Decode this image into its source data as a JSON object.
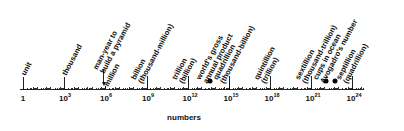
{
  "chart_data": {
    "type": "scatter",
    "title": "",
    "xlabel": "numbers",
    "ylabel": "",
    "xscale": "log10",
    "xlim_exponent": [
      0,
      25
    ],
    "grid": false,
    "legend": null,
    "ticks": [
      {
        "exponent": 0,
        "label": "1"
      },
      {
        "exponent": 3,
        "label": "10",
        "sup": "3"
      },
      {
        "exponent": 6,
        "label": "10",
        "sup": "6"
      },
      {
        "exponent": 9,
        "label": "10",
        "sup": "9"
      },
      {
        "exponent": 12,
        "label": "10",
        "sup": "12"
      },
      {
        "exponent": 15,
        "label": "10",
        "sup": "15"
      },
      {
        "exponent": 18,
        "label": "10",
        "sup": "18"
      },
      {
        "exponent": 21,
        "label": "10",
        "sup": "21"
      },
      {
        "exponent": 24,
        "label": "10",
        "sup": "24"
      }
    ],
    "named_numbers": [
      {
        "exponent": 0,
        "lines": [
          "unit"
        ],
        "marker": "line"
      },
      {
        "exponent": 3,
        "lines": [
          "thousand"
        ],
        "marker": "line"
      },
      {
        "exponent": 6,
        "lines": [
          "million"
        ],
        "marker": "arrow"
      },
      {
        "exponent": 9,
        "lines": [
          "billion",
          "(thousand-million)"
        ],
        "marker": "line"
      },
      {
        "exponent": 12,
        "lines": [
          "trillion",
          "(billion)"
        ],
        "marker": "line"
      },
      {
        "exponent": 15,
        "lines": [
          "quadrillion",
          "(thousand-billion)"
        ],
        "marker": "line"
      },
      {
        "exponent": 18,
        "lines": [
          "quintillion",
          "(trillion)"
        ],
        "marker": "line"
      },
      {
        "exponent": 21,
        "lines": [
          "sextillion",
          "(thousand-trillion)"
        ],
        "marker": "line"
      },
      {
        "exponent": 24,
        "lines": [
          "septillion",
          "(quadrillion)"
        ],
        "marker": "line"
      }
    ],
    "annotations": [
      {
        "exponent": 6,
        "lines": [
          "man-year to",
          "build a pyramid"
        ],
        "marker": "arrow"
      },
      {
        "exponent": 13.5,
        "lines": [
          "world's gross",
          "annual product"
        ],
        "marker": "dot"
      },
      {
        "exponent": 22.2,
        "lines": [
          "cups in ocean"
        ],
        "marker": "dot"
      },
      {
        "exponent": 23.8,
        "lines": [
          "Avogadro's number"
        ],
        "marker": "dot"
      }
    ]
  },
  "labels": {
    "xlabel": "numbers",
    "t0": "1",
    "t3": "10",
    "t3s": "3",
    "t6": "10",
    "t6s": "6",
    "t9": "10",
    "t9s": "9",
    "t12": "10",
    "t12s": "12",
    "t15": "10",
    "t15s": "15",
    "t18": "10",
    "t18s": "18",
    "t21": "10",
    "t21s": "21",
    "t24": "10",
    "t24s": "24",
    "unit": "unit",
    "thousand": "thousand",
    "manyear_1": "man-year to",
    "manyear_2": "build a pyramid",
    "million": "million",
    "billion_1": "billion",
    "billion_2": "(thousand-million)",
    "trillion_1": "trillion",
    "trillion_2": "(billion)",
    "gross_1": "world's gross",
    "gross_2": "annual product",
    "quad_1": "quadrillion",
    "quad_2": "(thousand-billion)",
    "quint_1": "quintillion",
    "quint_2": "(trillion)",
    "sext_1": "sextillion",
    "sext_2": "(thousand-trillion)",
    "cups": "cups in ocean",
    "avogadro": "Avogadro's number",
    "sept_1": "septillion",
    "sept_2": "(quadrillion)"
  }
}
